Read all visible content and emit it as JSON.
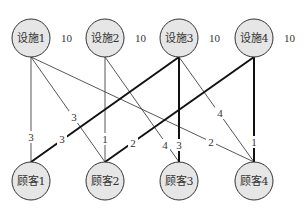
{
  "facilities": [
    {
      "id": "f1",
      "label": "设施1",
      "capacity": "10",
      "x": 31,
      "y": 38
    },
    {
      "id": "f2",
      "label": "设施2",
      "capacity": "10",
      "x": 105,
      "y": 38
    },
    {
      "id": "f3",
      "label": "设施3",
      "capacity": "10",
      "x": 179,
      "y": 38
    },
    {
      "id": "f4",
      "label": "设施4",
      "capacity": "10",
      "x": 254,
      "y": 38
    }
  ],
  "customers": [
    {
      "id": "c1",
      "label": "顾客1",
      "x": 31,
      "y": 181
    },
    {
      "id": "c2",
      "label": "顾客2",
      "x": 105,
      "y": 181
    },
    {
      "id": "c3",
      "label": "顾客3",
      "x": 179,
      "y": 181
    },
    {
      "id": "c4",
      "label": "顾客4",
      "x": 254,
      "y": 181
    }
  ],
  "edges": [
    {
      "from": "f1",
      "to": "c1",
      "weight": "3",
      "bold": false,
      "lx": 31,
      "ly": 138
    },
    {
      "from": "f1",
      "to": "c2",
      "weight": "3",
      "bold": false,
      "lx": 74,
      "ly": 118
    },
    {
      "from": "f1",
      "to": "c4",
      "weight": "2",
      "bold": false,
      "lx": 211,
      "ly": 143
    },
    {
      "from": "f2",
      "to": "c2",
      "weight": "1",
      "bold": false,
      "lx": 105,
      "ly": 140
    },
    {
      "from": "f2",
      "to": "c3",
      "weight": "4",
      "bold": false,
      "lx": 165,
      "ly": 146
    },
    {
      "from": "f3",
      "to": "c1",
      "weight": "3",
      "bold": true,
      "lx": 62,
      "ly": 140
    },
    {
      "from": "f3",
      "to": "c3",
      "weight": "3",
      "bold": true,
      "lx": 179,
      "ly": 146
    },
    {
      "from": "f3",
      "to": "c4",
      "weight": "4",
      "bold": false,
      "lx": 220,
      "ly": 114
    },
    {
      "from": "f4",
      "to": "c2",
      "weight": "2",
      "bold": true,
      "lx": 133,
      "ly": 144
    },
    {
      "from": "f4",
      "to": "c4",
      "weight": "1",
      "bold": true,
      "lx": 254,
      "ly": 143
    }
  ]
}
